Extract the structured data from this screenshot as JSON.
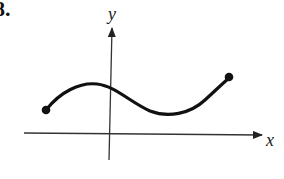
{
  "problem_number": "8.",
  "axes": {
    "x_label": "x",
    "y_label": "y"
  },
  "curve": {
    "description": "Smooth curve with closed endpoints; rises to a local max just left of the y-axis, dips to a local min right of the y-axis, then rises to the right endpoint",
    "left_endpoint": "closed-dot",
    "right_endpoint": "closed-dot",
    "color": "#111111"
  }
}
